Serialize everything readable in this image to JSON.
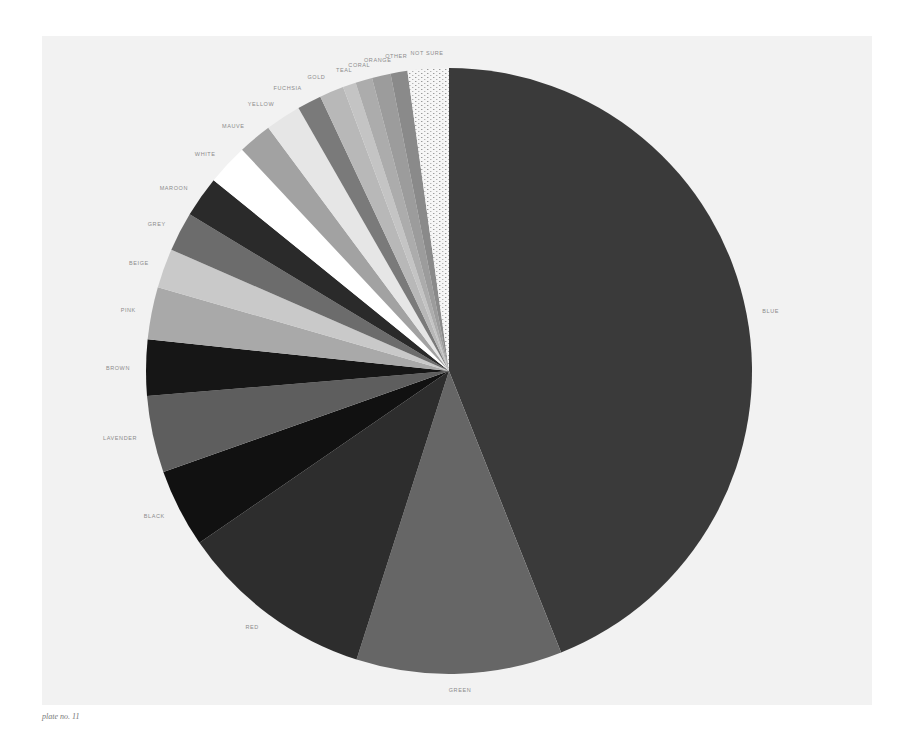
{
  "caption": "plate no. 11",
  "chart_data": {
    "type": "pie",
    "title": "",
    "start_angle_deg": 0,
    "direction": "clockwise",
    "legend": "none (labels placed around rim)",
    "categories": [
      "BLUE",
      "GREEN",
      "RED",
      "BLACK",
      "LAVENDER",
      "BROWN",
      "PINK",
      "BEIGE",
      "GREY",
      "MAROON",
      "WHITE",
      "MAUVE",
      "YELLOW",
      "FUCHSIA",
      "GOLD",
      "TEAL",
      "CORAL",
      "ORANGE",
      "OTHER",
      "NOT SURE"
    ],
    "values": [
      44.1,
      11.0,
      10.5,
      4.2,
      4.1,
      3.0,
      2.8,
      2.1,
      2.1,
      2.2,
      2.2,
      1.8,
      1.9,
      1.3,
      1.3,
      0.7,
      0.9,
      1.0,
      0.9,
      2.2
    ],
    "unit": "percent (estimated from slice angles)",
    "slice_colors": [
      "#3a3a3a",
      "#666666",
      "#2d2d2d",
      "#111111",
      "#5e5e5e",
      "#161616",
      "#a9a9a9",
      "#c9c9c9",
      "#6c6c6c",
      "#2a2a2a",
      "#ffffff",
      "#a2a2a2",
      "#e6e6e6",
      "#7a7a7a",
      "#b8b8b8",
      "#c4c4c4",
      "#acacac",
      "#9c9c9c",
      "#8a8a8a",
      "#f4f4f4"
    ],
    "slice_patterns": {
      "NOT SURE": "dotted"
    }
  }
}
